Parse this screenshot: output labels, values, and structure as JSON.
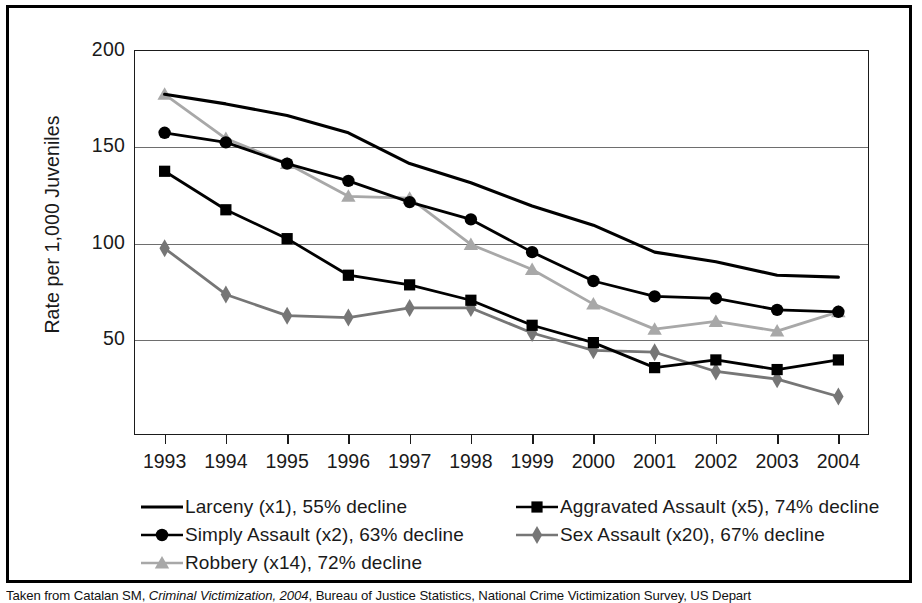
{
  "figure": {
    "caption_prefix": "Taken from Catalan SM, ",
    "caption_italic": "Criminal Victimization, 2004",
    "caption_suffix": ", Bureau of Justice Statistics, National Crime Victimization Survey, US Depart"
  },
  "chart_data": {
    "type": "line",
    "title": "",
    "xlabel": "",
    "ylabel": "Rate per 1,000 Juveniles",
    "categories": [
      "1993",
      "1994",
      "1995",
      "1996",
      "1997",
      "1998",
      "1999",
      "2000",
      "2001",
      "2002",
      "2003",
      "2004"
    ],
    "ylim": [
      0,
      200
    ],
    "yticks": [
      50,
      100,
      150,
      200
    ],
    "ytick_labels": [
      "50",
      "100",
      "150",
      "200"
    ],
    "grid": "horizontal",
    "legend_position": "below",
    "series": [
      {
        "name": "Larceny (x1), 55% decline",
        "short_name": "Larceny",
        "multiplier": "x1",
        "decline": "55% decline",
        "marker": "none",
        "color": "#000000",
        "values": [
          177,
          172,
          166,
          157,
          141,
          131,
          119,
          109,
          95,
          90,
          83,
          82
        ]
      },
      {
        "name": "Simply Assault (x2), 63% decline",
        "short_name": "Simply Assault",
        "multiplier": "x2",
        "decline": "63% decline",
        "marker": "circle",
        "color": "#000000",
        "values": [
          157,
          152,
          141,
          132,
          121,
          112,
          95,
          80,
          72,
          71,
          65,
          64
        ]
      },
      {
        "name": "Robbery (x14), 72% decline",
        "short_name": "Robbery",
        "multiplier": "x14",
        "decline": "72% decline",
        "marker": "triangle",
        "color": "#a8a8a8",
        "values": [
          177,
          154,
          141,
          124,
          123,
          99,
          86,
          68,
          55,
          59,
          54,
          64
        ]
      },
      {
        "name": "Aggravated Assault (x5), 74% decline",
        "short_name": "Aggravated Assault",
        "multiplier": "x5",
        "decline": "74% decline",
        "marker": "square",
        "color": "#000000",
        "values": [
          137,
          117,
          102,
          83,
          78,
          70,
          57,
          48,
          35,
          39,
          34,
          39
        ]
      },
      {
        "name": "Sex Assault (x20), 67% decline",
        "short_name": "Sex Assault",
        "multiplier": "x20",
        "decline": "67% decline",
        "marker": "diamond",
        "color": "#767676",
        "values": [
          97,
          73,
          62,
          61,
          66,
          66,
          53,
          44,
          43,
          33,
          29,
          20
        ]
      }
    ]
  },
  "legend": {
    "columns": [
      {
        "items": [
          0,
          1,
          2
        ]
      },
      {
        "items": [
          3,
          4
        ]
      }
    ]
  }
}
